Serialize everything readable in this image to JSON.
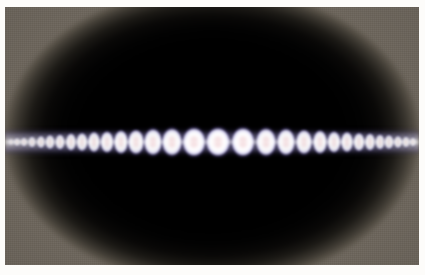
{
  "figure": {
    "kind": "photographic-plate",
    "caption": "",
    "title": ""
  },
  "plate": {
    "background_color": "#6d665c",
    "disc_color": "#000000",
    "margin_color": "#fdfcfa",
    "x": 5,
    "y": 7,
    "width": 414,
    "height": 258
  },
  "pattern": {
    "name": "interference-fringe-band",
    "center_y": 135,
    "lobe_count": 31,
    "core_color": "#f3cfd2",
    "body_color": "#ffffff",
    "node_color": "#2a2246",
    "rim_color": "#c9c5e6",
    "lobes": [
      {
        "cx": 6,
        "w": 6,
        "h": 7,
        "o": 0.55
      },
      {
        "cx": 12,
        "w": 7,
        "h": 9,
        "o": 0.62
      },
      {
        "cx": 19,
        "w": 7,
        "h": 10,
        "o": 0.68
      },
      {
        "cx": 27,
        "w": 8,
        "h": 12,
        "o": 0.72
      },
      {
        "cx": 36,
        "w": 9,
        "h": 13,
        "o": 0.76
      },
      {
        "cx": 45,
        "w": 10,
        "h": 15,
        "o": 0.8
      },
      {
        "cx": 55,
        "w": 10,
        "h": 16,
        "o": 0.83
      },
      {
        "cx": 66,
        "w": 11,
        "h": 18,
        "o": 0.86
      },
      {
        "cx": 77,
        "w": 12,
        "h": 19,
        "o": 0.88
      },
      {
        "cx": 89,
        "w": 13,
        "h": 21,
        "o": 0.9
      },
      {
        "cx": 102,
        "w": 14,
        "h": 22,
        "o": 0.92
      },
      {
        "cx": 116,
        "w": 15,
        "h": 24,
        "o": 0.94
      },
      {
        "cx": 131,
        "w": 17,
        "h": 25,
        "o": 0.95
      },
      {
        "cx": 148,
        "w": 19,
        "h": 27,
        "o": 0.97
      },
      {
        "cx": 167,
        "w": 21,
        "h": 28,
        "o": 0.98
      },
      {
        "cx": 189,
        "w": 24,
        "h": 29,
        "o": 1.0
      },
      {
        "cx": 213,
        "w": 25,
        "h": 29,
        "o": 1.0
      },
      {
        "cx": 238,
        "w": 24,
        "h": 29,
        "o": 1.0
      },
      {
        "cx": 261,
        "w": 21,
        "h": 28,
        "o": 0.98
      },
      {
        "cx": 281,
        "w": 19,
        "h": 27,
        "o": 0.97
      },
      {
        "cx": 299,
        "w": 17,
        "h": 25,
        "o": 0.95
      },
      {
        "cx": 315,
        "w": 15,
        "h": 24,
        "o": 0.94
      },
      {
        "cx": 329,
        "w": 14,
        "h": 22,
        "o": 0.92
      },
      {
        "cx": 342,
        "w": 13,
        "h": 21,
        "o": 0.9
      },
      {
        "cx": 354,
        "w": 12,
        "h": 19,
        "o": 0.88
      },
      {
        "cx": 365,
        "w": 11,
        "h": 18,
        "o": 0.86
      },
      {
        "cx": 375,
        "w": 10,
        "h": 16,
        "o": 0.83
      },
      {
        "cx": 384,
        "w": 10,
        "h": 15,
        "o": 0.8
      },
      {
        "cx": 393,
        "w": 9,
        "h": 13,
        "o": 0.76
      },
      {
        "cx": 401,
        "w": 8,
        "h": 12,
        "o": 0.72
      },
      {
        "cx": 408,
        "w": 7,
        "h": 10,
        "o": 0.66
      }
    ]
  }
}
